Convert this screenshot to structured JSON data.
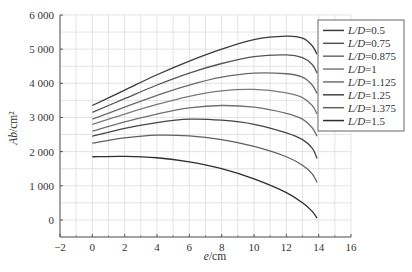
{
  "chart_data": {
    "type": "line",
    "title": "",
    "xlabel": "e/cm",
    "ylabel": "Ab/cm²",
    "xlim": [
      -2,
      16
    ],
    "ylim": [
      -500,
      6000
    ],
    "x_ticks": [
      -2,
      0,
      2,
      4,
      6,
      8,
      10,
      12,
      14,
      16
    ],
    "x_tick_labels": [
      "−2",
      "0",
      "2",
      "4",
      "6",
      "8",
      "10",
      "12",
      "14",
      "16"
    ],
    "y_ticks": [
      0,
      1000,
      2000,
      3000,
      4000,
      5000,
      6000
    ],
    "y_tick_labels": [
      "0",
      "1 000",
      "2 000",
      "3 000",
      "4 000",
      "5 000",
      "6 000"
    ],
    "grid": true,
    "grid_minor_x_step": 1,
    "grid_minor_y_step": 500,
    "legend_position": "upper right (outside plot edge)",
    "x": [
      0,
      2,
      4,
      6,
      8,
      10,
      12,
      13,
      13.6,
      13.9
    ],
    "series": [
      {
        "name": "L/D=0.5",
        "color": "#3a3a3a",
        "values": [
          3350,
          3800,
          4250,
          4650,
          5000,
          5280,
          5380,
          5320,
          5100,
          4850
        ]
      },
      {
        "name": "L/D=0.75",
        "color": "#555555",
        "values": [
          3150,
          3550,
          3950,
          4300,
          4580,
          4780,
          4830,
          4750,
          4550,
          4300
        ]
      },
      {
        "name": "L/D=0.875",
        "color": "#6a6a6a",
        "values": [
          2950,
          3300,
          3650,
          3950,
          4180,
          4300,
          4280,
          4180,
          3950,
          3700
        ]
      },
      {
        "name": "L/D=1",
        "color": "#7a7a7a",
        "values": [
          2800,
          3100,
          3380,
          3620,
          3780,
          3820,
          3720,
          3580,
          3350,
          3100
        ]
      },
      {
        "name": "L/D=1.125",
        "color": "#6f6f6f",
        "values": [
          2600,
          2870,
          3100,
          3280,
          3350,
          3300,
          3120,
          2950,
          2700,
          2450
        ]
      },
      {
        "name": "L/D=1.25",
        "color": "#444444",
        "values": [
          2450,
          2680,
          2850,
          2950,
          2920,
          2800,
          2550,
          2350,
          2100,
          1800
        ]
      },
      {
        "name": "L/D=1.375",
        "color": "#606060",
        "values": [
          2250,
          2400,
          2480,
          2460,
          2350,
          2150,
          1850,
          1600,
          1350,
          1100
        ]
      },
      {
        "name": "L/D=1.5",
        "color": "#2e2e2e",
        "values": [
          1850,
          1860,
          1820,
          1700,
          1500,
          1200,
          800,
          500,
          250,
          50
        ]
      }
    ]
  },
  "layout": {
    "plot_left": 60,
    "plot_right": 351,
    "plot_top": 15,
    "plot_bottom": 237,
    "legend_box": {
      "x": 318,
      "y": 20,
      "w": 86,
      "h": 111
    }
  }
}
